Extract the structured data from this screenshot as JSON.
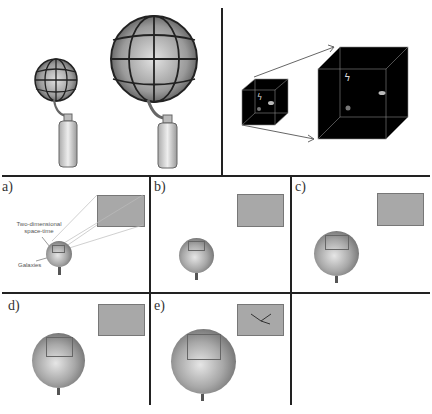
{
  "top_left": {
    "description": "Two balloons with grid lines inflated from bottles",
    "balloon_small": {
      "label": ""
    },
    "balloon_large": {
      "label": ""
    }
  },
  "top_right": {
    "description": "Small black cube expanding into large black cube with arrows"
  },
  "panels": [
    {
      "label": "a)",
      "annotation_1": "Two-dimensional space-time",
      "annotation_2": "Galaxies"
    },
    {
      "label": "b)"
    },
    {
      "label": "c)"
    },
    {
      "label": "d)"
    },
    {
      "label": "e)"
    }
  ],
  "colors": {
    "line": "#222222",
    "inset": "#a8a8a8",
    "cube": "#000000"
  }
}
